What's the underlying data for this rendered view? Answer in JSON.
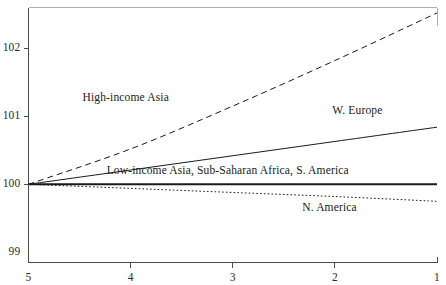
{
  "figure": {
    "background_color": "#ffffff",
    "axis_color": "#4a4a4a",
    "line_color": "#1a1a1a",
    "clipped_header_fragment": "  "
  },
  "chart_data": {
    "type": "line",
    "title": "",
    "subtitle": "",
    "xlabel": "",
    "ylabel": "",
    "grid": false,
    "legend_position": "inline-annotations",
    "x": [
      5,
      4,
      3,
      2,
      1
    ],
    "x_tick_labels": [
      "5",
      "4",
      "3",
      "2",
      "1"
    ],
    "x_axis_reversed": true,
    "xlim": [
      5,
      1
    ],
    "y_tick_labels": [
      "99",
      "100",
      "101",
      "102"
    ],
    "y_ticks": [
      99,
      100,
      101,
      102
    ],
    "ylim": [
      98.85,
      102.6
    ],
    "series": [
      {
        "name": "High-income Asia",
        "style": "dashed",
        "label": "High-income Asia",
        "label_x": 4.05,
        "label_y": 101.25,
        "values": [
          100.0,
          100.52,
          101.15,
          101.82,
          102.52
        ]
      },
      {
        "name": "W. Europe",
        "style": "solid",
        "label": "W. Europe",
        "label_x": 1.78,
        "label_y": 101.06,
        "values": [
          100.0,
          100.21,
          100.42,
          100.63,
          100.84
        ]
      },
      {
        "name": "Low-income Asia, Sub-Saharan Africa, S. America",
        "style": "solid-bold",
        "label": "Low-income Asia, Sub-Saharan Africa, S. America",
        "label_x": 3.05,
        "label_y": 100.18,
        "values": [
          100.0,
          100.0,
          100.0,
          100.0,
          100.0
        ]
      },
      {
        "name": "N. America",
        "style": "dotted",
        "label": "N. America",
        "label_x": 2.05,
        "label_y": 99.63,
        "values": [
          100.0,
          99.94,
          99.88,
          99.82,
          99.75
        ]
      }
    ]
  }
}
